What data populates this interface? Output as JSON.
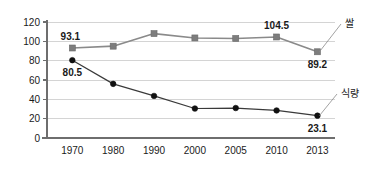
{
  "chart_data": {
    "type": "line",
    "title": "",
    "subtitle": "",
    "xlabel": "",
    "ylabel": "",
    "categories": [
      "1970",
      "1980",
      "1990",
      "2000",
      "2005",
      "2010",
      "2013"
    ],
    "ylim": [
      0,
      120
    ],
    "ytick_values": [
      0,
      20,
      40,
      60,
      80,
      100,
      120
    ],
    "ytick_labels": [
      "0",
      "20",
      "40",
      "60",
      "80",
      "100",
      "120"
    ],
    "grid": true,
    "legend_position": "right-inline-labels",
    "series": [
      {
        "name": "쌀",
        "marker": "square",
        "color": "#7d7d7d",
        "line_color": "#8a8a8a",
        "values": [
          93.1,
          95.0,
          108.0,
          103.5,
          103.0,
          104.5,
          89.2
        ]
      },
      {
        "name": "식량",
        "marker": "circle",
        "color": "#111111",
        "line_color": "#3a3a3a",
        "values": [
          80.5,
          56.0,
          43.5,
          30.5,
          31.0,
          28.5,
          23.1
        ]
      }
    ],
    "annotations": [
      {
        "text": "93.1",
        "series": "쌀",
        "category": "1970",
        "value": 93.1,
        "placement": "above-left"
      },
      {
        "text": "104.5",
        "series": "쌀",
        "category": "2010",
        "value": 104.5,
        "placement": "above"
      },
      {
        "text": "89.2",
        "series": "쌀",
        "category": "2013",
        "value": 89.2,
        "placement": "below"
      },
      {
        "text": "80.5",
        "series": "식량",
        "category": "1970",
        "value": 80.5,
        "placement": "below"
      },
      {
        "text": "23.1",
        "series": "식량",
        "category": "2013",
        "value": 23.1,
        "placement": "below"
      }
    ],
    "series_labels": [
      {
        "text": "쌀",
        "x": 345,
        "y": 23
      },
      {
        "text": "식량",
        "x": 341,
        "y": 93
      }
    ]
  }
}
